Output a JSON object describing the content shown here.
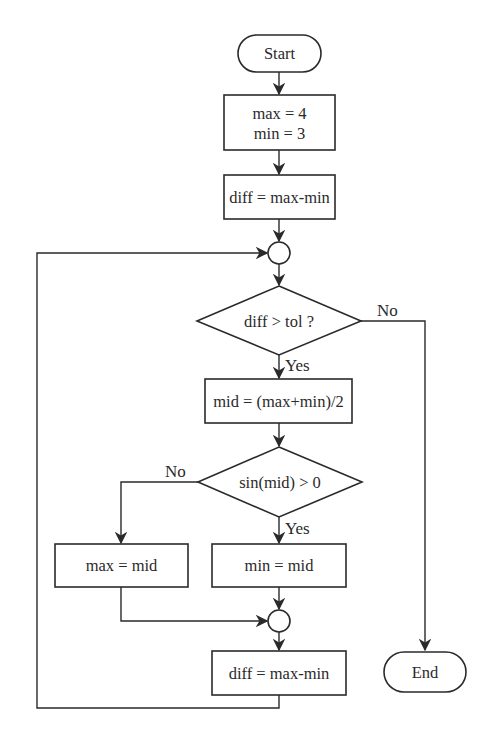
{
  "diagram": {
    "type": "flowchart",
    "nodes": {
      "start": {
        "kind": "terminal",
        "label": "Start"
      },
      "init": {
        "kind": "process",
        "lines": [
          "max = 4",
          "min = 3"
        ]
      },
      "diff1": {
        "kind": "process",
        "label": "diff = max-min"
      },
      "loop_join": {
        "kind": "connector",
        "label": ""
      },
      "cond_tol": {
        "kind": "decision",
        "label": "diff > tol ?"
      },
      "mid": {
        "kind": "process",
        "label": "mid = (max+min)/2"
      },
      "cond_sin": {
        "kind": "decision",
        "label": "sin(mid) > 0"
      },
      "set_max": {
        "kind": "process",
        "label": "max = mid"
      },
      "set_min": {
        "kind": "process",
        "label": "min = mid"
      },
      "merge_join": {
        "kind": "connector",
        "label": ""
      },
      "diff2": {
        "kind": "process",
        "label": "diff = max-min"
      },
      "end": {
        "kind": "terminal",
        "label": "End"
      }
    },
    "edge_labels": {
      "tol_no": "No",
      "tol_yes": "Yes",
      "sin_no": "No",
      "sin_yes": "Yes"
    },
    "edges": [
      {
        "from": "start",
        "to": "init"
      },
      {
        "from": "init",
        "to": "diff1"
      },
      {
        "from": "diff1",
        "to": "loop_join"
      },
      {
        "from": "loop_join",
        "to": "cond_tol"
      },
      {
        "from": "cond_tol",
        "to": "mid",
        "label": "Yes"
      },
      {
        "from": "cond_tol",
        "to": "end",
        "label": "No"
      },
      {
        "from": "mid",
        "to": "cond_sin"
      },
      {
        "from": "cond_sin",
        "to": "set_min",
        "label": "Yes"
      },
      {
        "from": "cond_sin",
        "to": "set_max",
        "label": "No"
      },
      {
        "from": "set_max",
        "to": "merge_join"
      },
      {
        "from": "set_min",
        "to": "merge_join"
      },
      {
        "from": "merge_join",
        "to": "diff2"
      },
      {
        "from": "diff2",
        "to": "loop_join"
      }
    ],
    "colors": {
      "stroke": "#2a2a2a",
      "fill": "#ffffff",
      "background": "#ffffff"
    }
  }
}
